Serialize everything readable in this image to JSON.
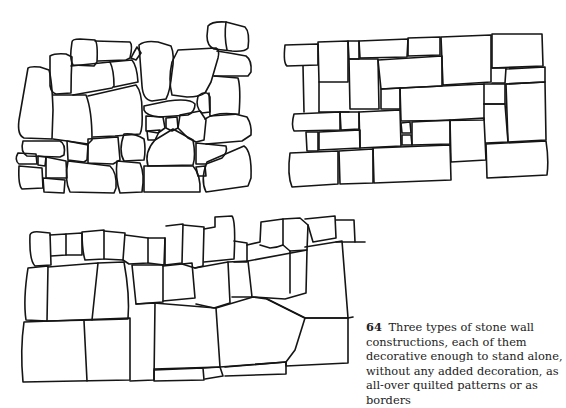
{
  "page": {
    "figure_number": "64",
    "caption_text": "Three types of stone wall constructions, each of them decorative enough to stand alone, without any added decoration, as all-over quilted patterns or as borders"
  },
  "figures": [
    {
      "id": "wall-polygonal",
      "description": "Irregular polygonal rubble stone wall"
    },
    {
      "id": "wall-rectangular",
      "description": "Rectangular ashlar stone wall with quilted pattern"
    },
    {
      "id": "wall-coursed",
      "description": "Coursed stone wall with irregular top edge"
    }
  ]
}
